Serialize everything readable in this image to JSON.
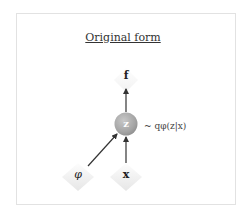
{
  "diagram": {
    "title": "Original form",
    "nodes": [
      {
        "id": "f",
        "label": "f",
        "shape": "diamond",
        "style": "deterministic",
        "x": 126,
        "y": 78
      },
      {
        "id": "z",
        "label": "z",
        "shape": "circle",
        "style": "stochastic",
        "x": 126,
        "y": 124,
        "fill": "#a9a9a9"
      },
      {
        "id": "phi",
        "label": "φ",
        "shape": "diamond",
        "style": "deterministic",
        "x": 78,
        "y": 175
      },
      {
        "id": "x",
        "label": "x",
        "shape": "diamond",
        "style": "deterministic",
        "x": 126,
        "y": 175
      }
    ],
    "edges": [
      {
        "from": "z",
        "to": "f"
      },
      {
        "from": "phi",
        "to": "z"
      },
      {
        "from": "x",
        "to": "z"
      }
    ],
    "annotations": {
      "z_distribution": "~ qφ(z|x)"
    },
    "colors": {
      "frame_border": "#e2e2e2",
      "stochastic_node": "#a9a9a9",
      "diamond_fill": "#f4f4f4",
      "edge": "#333333"
    }
  }
}
